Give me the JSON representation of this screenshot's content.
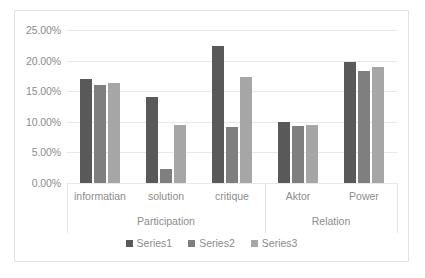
{
  "chart_data": {
    "type": "bar",
    "title": "",
    "subtitle": "",
    "xlabel": "",
    "ylabel": "",
    "categories": [
      "informatian",
      "solution",
      "critique",
      "Aktor",
      "Power"
    ],
    "group_axis": [
      {
        "label": "Participation",
        "categories": [
          "informatian",
          "solution",
          "critique"
        ]
      },
      {
        "label": "Relation",
        "categories": [
          "Aktor",
          "Power"
        ]
      }
    ],
    "series": [
      {
        "name": "Series1",
        "color": "#595959",
        "values": [
          17.0,
          14.0,
          22.4,
          10.0,
          19.8
        ]
      },
      {
        "name": "Series2",
        "color": "#7f7f7f",
        "values": [
          16.0,
          2.3,
          9.2,
          9.3,
          18.3
        ]
      },
      {
        "name": "Series3",
        "color": "#a6a6a6",
        "values": [
          16.4,
          9.4,
          17.3,
          9.4,
          19.0
        ]
      }
    ],
    "ylim": [
      0,
      25
    ],
    "yticks": [
      0,
      5,
      10,
      15,
      20,
      25
    ],
    "ytick_labels": [
      "0.00%",
      "5.00%",
      "10.00%",
      "15.00%",
      "20.00%",
      "25.00%"
    ],
    "grid": true,
    "legend_position": "bottom",
    "legend_entries": [
      "Series1",
      "Series2",
      "Series3"
    ],
    "value_format": "percent"
  }
}
